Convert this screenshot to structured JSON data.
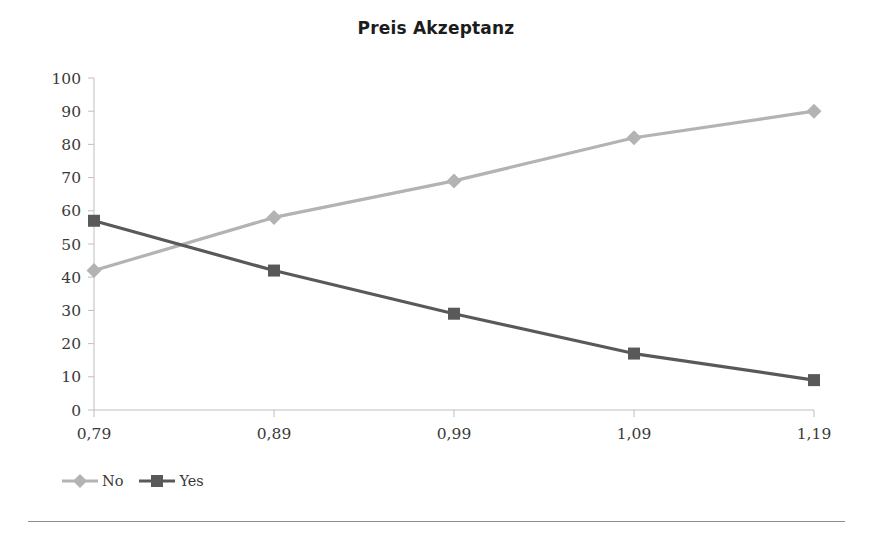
{
  "chart_data": {
    "type": "line",
    "title": "Preis Akzeptanz",
    "xlabel": "",
    "ylabel": "",
    "categories": [
      "0,79",
      "0,89",
      "0,99",
      "1,09",
      "1,19"
    ],
    "x_values": [
      0.79,
      0.89,
      0.99,
      1.09,
      1.19
    ],
    "ylim": [
      0,
      100
    ],
    "y_ticks": [
      "0",
      "10",
      "20",
      "30",
      "40",
      "50",
      "60",
      "70",
      "80",
      "90",
      "100"
    ],
    "y_tick_values": [
      0,
      10,
      20,
      30,
      40,
      50,
      60,
      70,
      80,
      90,
      100
    ],
    "grid": false,
    "legend_position": "bottom-left",
    "series": [
      {
        "name": "No",
        "values": [
          42,
          58,
          69,
          82,
          90
        ],
        "color": "#b3b3b3",
        "marker": "diamond"
      },
      {
        "name": "Yes",
        "values": [
          57,
          42,
          29,
          17,
          9
        ],
        "color": "#595959",
        "marker": "square"
      }
    ]
  },
  "axis": {
    "axis_color": "#bfbfbf",
    "tick_color": "#bfbfbf"
  },
  "legend": {
    "entries": [
      {
        "label": "No",
        "color": "#b3b3b3",
        "marker": "diamond"
      },
      {
        "label": "Yes",
        "color": "#595959",
        "marker": "square"
      }
    ]
  },
  "footer": {
    "rule_color": "#8c8c8c"
  }
}
